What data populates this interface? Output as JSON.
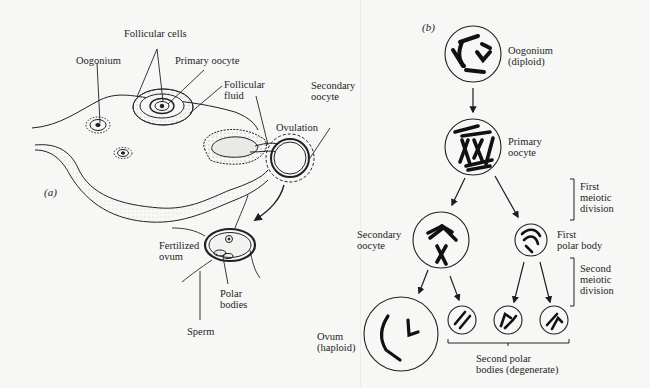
{
  "panel_a": {
    "tag": "(a)",
    "labels": {
      "follicular_cells": "Follicular cells",
      "oogonium": "Oogonium",
      "primary_oocyte": "Primary oocyte",
      "follicular_fluid": [
        "Follicular",
        "fluid"
      ],
      "secondary_oocyte": [
        "Secondary",
        "oocyte"
      ],
      "ovulation": "Ovulation",
      "fertilized_ovum": [
        "Fertilized",
        "ovum"
      ],
      "polar_bodies": [
        "Polar",
        "bodies"
      ],
      "sperm": "Sperm"
    }
  },
  "panel_b": {
    "tag": "(b)",
    "labels": {
      "oogonium": [
        "Oogonium",
        "(diploid)"
      ],
      "primary_oocyte": [
        "Primary",
        "oocyte"
      ],
      "secondary_oocyte": [
        "Secondary",
        "oocyte"
      ],
      "first_polar_body": [
        "First",
        "polar body"
      ],
      "ovum": [
        "Ovum",
        "(haploid)"
      ],
      "second_polar_bodies": [
        "Second polar",
        "bodies (degenerate)"
      ]
    },
    "brackets": {
      "first_meiotic_division": [
        "First",
        "meiotic",
        "division"
      ],
      "second_meiotic_division": [
        "Second",
        "meiotic",
        "division"
      ]
    }
  },
  "colors": {
    "background": "#f7f7f6",
    "ink": "#1c1c1c",
    "stipple": "#bdbdbb"
  }
}
